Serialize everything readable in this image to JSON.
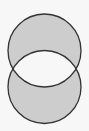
{
  "diagram": {
    "type": "venn",
    "shaded_region": "symmetric-difference",
    "sets": [
      {
        "name": "top-circle",
        "cx": 44.5,
        "cy": 50.5,
        "r": 36.5
      },
      {
        "name": "bottom-circle",
        "cx": 44.5,
        "cy": 87,
        "r": 36.5
      }
    ],
    "colors": {
      "background": "#f7f7f7",
      "shaded_fill": "#cdcdcd",
      "intersection_fill": "#f7f7f7",
      "stroke": "#333333"
    },
    "stroke_width": 1.3
  }
}
